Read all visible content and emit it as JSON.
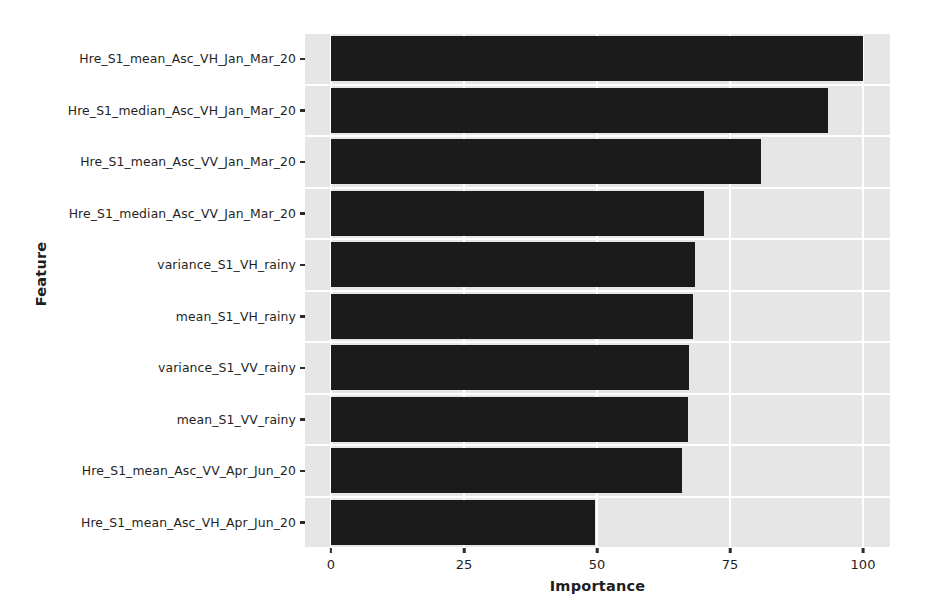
{
  "chart_data": {
    "type": "bar",
    "orientation": "horizontal",
    "title": "",
    "xlabel": "Importance",
    "ylabel": "Feature",
    "xlim": [
      0,
      105
    ],
    "xticks": [
      0,
      25,
      50,
      75,
      100
    ],
    "xtick_labels": [
      "0",
      "25",
      "50",
      "75",
      "100"
    ],
    "grid": true,
    "grid_axis": "both",
    "legend": "none",
    "bar_color": "#1b1b1b",
    "plot_background": "#e6e6e6",
    "gridline_color": "#ffffff",
    "categories": [
      "Hre_S1_mean_Asc_VH_Jan_Mar_20",
      "Hre_S1_median_Asc_VH_Jan_Mar_20",
      "Hre_S1_mean_Asc_VV_Jan_Mar_20",
      "Hre_S1_median_Asc_VV_Jan_Mar_20",
      "variance_S1_VH_rainy",
      "mean_S1_VH_rainy",
      "variance_S1_VV_rainy",
      "mean_S1_VV_rainy",
      "Hre_S1_mean_Asc_VV_Apr_Jun_20",
      "Hre_S1_mean_Asc_VH_Apr_Jun_20"
    ],
    "values": [
      100,
      93.4,
      80.8,
      70.1,
      68.4,
      68.0,
      67.3,
      67.1,
      66.0,
      49.6
    ]
  }
}
